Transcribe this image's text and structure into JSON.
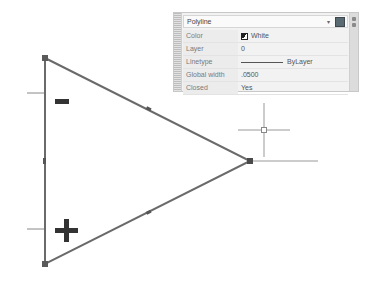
{
  "quick_properties": {
    "object_type": "Polyline",
    "dropdown_icon": "chevron-down-icon",
    "select_objects_icon": "quick-select-icon",
    "rows": [
      {
        "label": "Color",
        "value": "White"
      },
      {
        "label": "Layer",
        "value": "0"
      },
      {
        "label": "Linetype",
        "value": "ByLayer"
      },
      {
        "label": "Global width",
        "value": ".0500"
      },
      {
        "label": "Closed",
        "value": "Yes"
      }
    ]
  },
  "drawing": {
    "shape": "triangle-polyline",
    "vertices": [
      [
        45,
        58
      ],
      [
        250,
        161
      ],
      [
        45,
        264
      ]
    ],
    "line_color": "#6a6a6a",
    "grip_color": "#5a5a5a",
    "minus_label": "-",
    "plus_label": "+",
    "crosshair": {
      "x": 264,
      "y": 130
    }
  }
}
